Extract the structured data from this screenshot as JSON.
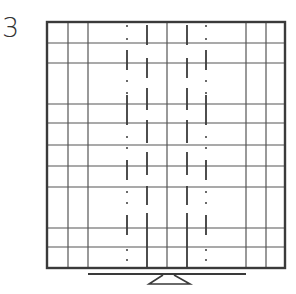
{
  "figure": {
    "label": "3",
    "colors": {
      "stroke": "#3a3a3a",
      "grid": "#555555",
      "background": "#ffffff"
    },
    "frame": {
      "left": 47,
      "top": 22,
      "right": 285,
      "bottom": 268
    },
    "row_lines_y": [
      43,
      63,
      104,
      123,
      145,
      166,
      187,
      228,
      247
    ],
    "solid_columns_x": [
      68,
      88,
      167,
      246,
      266
    ],
    "patterned_columns": [
      {
        "x": 127,
        "style": "dot-dash"
      },
      {
        "x": 147,
        "style": "dash"
      },
      {
        "x": 187,
        "style": "dash"
      },
      {
        "x": 206,
        "style": "dot-dash"
      }
    ],
    "stand": {
      "bar_y": 274,
      "bar_x1": 88,
      "bar_x2": 246,
      "foot_y": 284
    }
  }
}
